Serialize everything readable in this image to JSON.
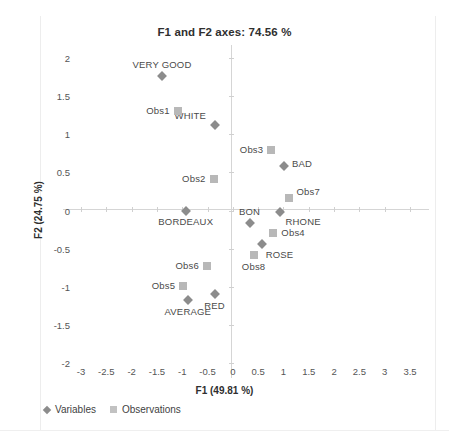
{
  "top_ghost_text": "",
  "chart_data": {
    "type": "scatter",
    "title": "F1 and F2 axes: 74.56 %",
    "xlabel": "F1 (49.81 %)",
    "ylabel": "F2 (24.75 %)",
    "xlim": [
      -3,
      3.5
    ],
    "ylim": [
      -2,
      2
    ],
    "xticks": [
      "-3",
      "-2.5",
      "-2",
      "-1.5",
      "-1",
      "-0.5",
      "0",
      "0.5",
      "1",
      "1.5",
      "2",
      "2.5",
      "3",
      "3.5"
    ],
    "xtick_values": [
      -3,
      -2.5,
      -2,
      -1.5,
      -1,
      -0.5,
      0,
      0.5,
      1,
      1.5,
      2,
      2.5,
      3,
      3.5
    ],
    "yticks": [
      "2",
      "1.5",
      "1",
      "0.5",
      "0",
      "-0.5",
      "-1",
      "-1.5",
      "-2"
    ],
    "ytick_values": [
      2,
      1.5,
      1,
      0.5,
      0,
      -0.5,
      -1,
      -1.5,
      -2
    ],
    "grid": false,
    "legend_position": "bottom-left",
    "colors": {
      "variables": "#8c8c8c",
      "observations": "#b8b8b8",
      "axis": "#d5d5d5",
      "text": "#4a4a4a"
    },
    "series": [
      {
        "name": "Variables",
        "marker": "diamond",
        "color": "#8c8c8c",
        "points": [
          {
            "label": "VERY GOOD",
            "x": -1.4,
            "y": 1.77,
            "label_dx": 0,
            "label_dy": -11,
            "label_anchor": "center"
          },
          {
            "label": "WHITE",
            "x": -0.35,
            "y": 1.12,
            "label_dx": -9,
            "label_dy": -9,
            "label_anchor": "right"
          },
          {
            "label": "BAD",
            "x": 1.01,
            "y": 0.59,
            "label_dx": 8,
            "label_dy": -2,
            "label_anchor": "left"
          },
          {
            "label": "BORDEAUX",
            "x": -0.93,
            "y": 0.0,
            "label_dx": 0,
            "label_dy": 11,
            "label_anchor": "center"
          },
          {
            "label": "RHONE",
            "x": 0.94,
            "y": -0.02,
            "label_dx": 5,
            "label_dy": 10,
            "label_anchor": "left"
          },
          {
            "label": "BON",
            "x": 0.33,
            "y": -0.17,
            "label_dx": 0,
            "label_dy": -11,
            "label_anchor": "center"
          },
          {
            "label": "ROSE",
            "x": 0.57,
            "y": -0.44,
            "label_dx": 4,
            "label_dy": 11,
            "label_anchor": "left"
          },
          {
            "label": "RED",
            "x": -0.36,
            "y": -1.09,
            "label_dx": 0,
            "label_dy": 12,
            "label_anchor": "center"
          },
          {
            "label": "AVERAGE",
            "x": -0.89,
            "y": -1.18,
            "label_dx": 0,
            "label_dy": 12,
            "label_anchor": "center"
          }
        ]
      },
      {
        "name": "Observations",
        "marker": "square",
        "color": "#b8b8b8",
        "points": [
          {
            "label": "Obs1",
            "x": -1.09,
            "y": 1.3,
            "label_dx": -8,
            "label_dy": 0,
            "label_anchor": "right"
          },
          {
            "label": "Obs2",
            "x": -0.38,
            "y": 0.41,
            "label_dx": -8,
            "label_dy": 0,
            "label_anchor": "right"
          },
          {
            "label": "Obs3",
            "x": 0.76,
            "y": 0.79,
            "label_dx": -8,
            "label_dy": 0,
            "label_anchor": "right"
          },
          {
            "label": "Obs7",
            "x": 1.1,
            "y": 0.16,
            "label_dx": 8,
            "label_dy": -6,
            "label_anchor": "left"
          },
          {
            "label": "Obs4",
            "x": 0.8,
            "y": -0.29,
            "label_dx": 8,
            "label_dy": 0,
            "label_anchor": "left"
          },
          {
            "label": "Obs8",
            "x": 0.41,
            "y": -0.58,
            "label_dx": 0,
            "label_dy": 12,
            "label_anchor": "center"
          },
          {
            "label": "Obs6",
            "x": -0.51,
            "y": -0.73,
            "label_dx": -8,
            "label_dy": 0,
            "label_anchor": "right"
          },
          {
            "label": "Obs5",
            "x": -0.98,
            "y": -0.99,
            "label_dx": -8,
            "label_dy": 0,
            "label_anchor": "right"
          }
        ]
      }
    ]
  },
  "legend": {
    "items": [
      {
        "label": "Variables",
        "marker": "diamond"
      },
      {
        "label": "Observations",
        "marker": "square"
      }
    ]
  }
}
